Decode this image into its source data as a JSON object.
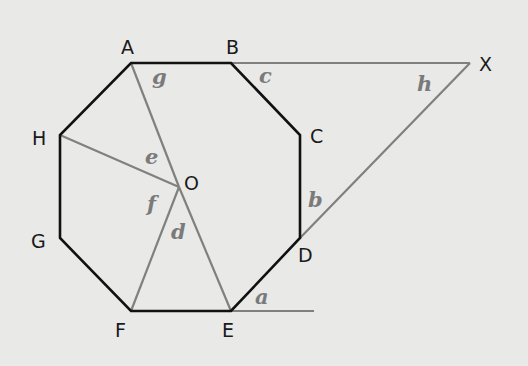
{
  "diagram": {
    "colors": {
      "background": "#e9e9e7",
      "octagon_edge": "#111111",
      "construction_line": "#808080",
      "angle_label": "#7a7a7a",
      "vertex_label": "#1a1a1a"
    },
    "vertices": {
      "A": {
        "label": "A",
        "x": 131,
        "y": 63
      },
      "B": {
        "label": "B",
        "x": 231,
        "y": 63
      },
      "C": {
        "label": "C",
        "x": 300,
        "y": 135
      },
      "D": {
        "label": "D",
        "x": 300,
        "y": 238
      },
      "E": {
        "label": "E",
        "x": 231,
        "y": 311
      },
      "F": {
        "label": "F",
        "x": 131,
        "y": 311
      },
      "G": {
        "label": "G",
        "x": 60,
        "y": 238
      },
      "H": {
        "label": "H",
        "x": 60,
        "y": 135
      },
      "O": {
        "label": "O",
        "x": 179,
        "y": 187
      },
      "X": {
        "label": "X",
        "x": 470,
        "y": 63
      }
    },
    "angles": [
      {
        "name": "a",
        "label": "a",
        "at": "E"
      },
      {
        "name": "b",
        "label": "b",
        "at": "D"
      },
      {
        "name": "c",
        "label": "c",
        "at": "B"
      },
      {
        "name": "d",
        "label": "d",
        "at": "O"
      },
      {
        "name": "e",
        "label": "e",
        "at": "O"
      },
      {
        "name": "f",
        "label": "f",
        "at": "O"
      },
      {
        "name": "g",
        "label": "g",
        "at": "A"
      },
      {
        "name": "h",
        "label": "h",
        "at": "X"
      }
    ]
  }
}
